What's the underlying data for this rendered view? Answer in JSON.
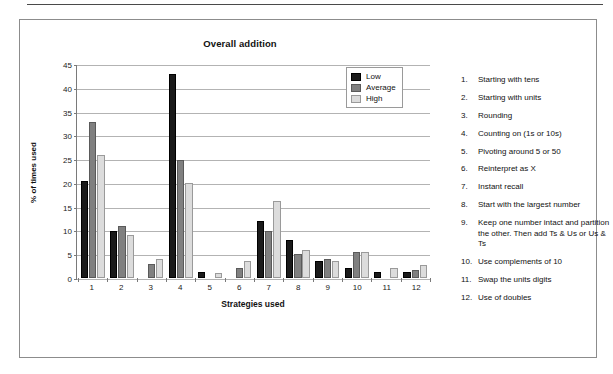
{
  "figure": {
    "title": "Overall addition"
  },
  "chart_data": {
    "type": "bar",
    "title": "Overall addition",
    "xlabel": "Strategies used",
    "ylabel": "% of times used",
    "ylim": [
      0,
      45
    ],
    "yticks": [
      0,
      5,
      10,
      15,
      20,
      25,
      30,
      35,
      40,
      45
    ],
    "grid": true,
    "legend_position": "top-right",
    "categories": [
      "1",
      "2",
      "3",
      "4",
      "5",
      "6",
      "7",
      "8",
      "9",
      "10",
      "11",
      "12"
    ],
    "series": [
      {
        "name": "Low",
        "color": "#1a1a1a",
        "values": [
          20.5,
          10.0,
          0,
          43.0,
          1.2,
          0,
          12.0,
          8.0,
          3.6,
          2.2,
          1.2,
          1.2
        ]
      },
      {
        "name": "Average",
        "color": "#808080",
        "values": [
          33.0,
          11.0,
          3.0,
          25.0,
          0,
          2.2,
          10.0,
          5.0,
          4.1,
          5.6,
          0,
          1.7
        ]
      },
      {
        "name": "High",
        "color": "#dcdcdc",
        "values": [
          26.0,
          9.0,
          4.0,
          20.0,
          1.0,
          3.7,
          16.2,
          6.0,
          3.7,
          5.6,
          2.2,
          2.7
        ]
      }
    ]
  },
  "legend": {
    "items": [
      {
        "label": "Low",
        "swatch": "low"
      },
      {
        "label": "Average",
        "swatch": "average"
      },
      {
        "label": "High",
        "swatch": "high"
      }
    ]
  },
  "key_list": [
    {
      "num": "1.",
      "text": "Starting with tens"
    },
    {
      "num": "2.",
      "text": "Starting with units"
    },
    {
      "num": "3.",
      "text": "Rounding"
    },
    {
      "num": "4.",
      "text": "Counting on (1s or 10s)"
    },
    {
      "num": "5.",
      "text": "Pivoting around 5 or 50"
    },
    {
      "num": "6.",
      "text": "Reinterpret as X"
    },
    {
      "num": "7.",
      "text": "Instant recall"
    },
    {
      "num": "8.",
      "text": "Start with the largest number"
    },
    {
      "num": "9.",
      "text": "Keep one number intact and partition the other. Then add Ts & Us or Us & Ts"
    },
    {
      "num": "10.",
      "text": "Use complements of 10"
    },
    {
      "num": "11.",
      "text": "Swap the units digits"
    },
    {
      "num": "12.",
      "text": "Use of doubles"
    }
  ]
}
